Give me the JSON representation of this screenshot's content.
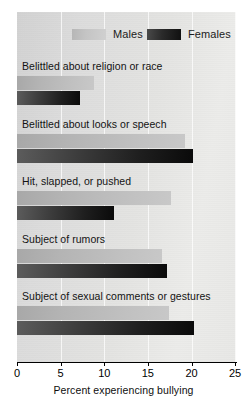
{
  "chart_data": {
    "type": "bar",
    "orientation": "horizontal",
    "title": "",
    "xlabel": "Percent experiencing bullying",
    "ylabel": "",
    "xlim": [
      0,
      25
    ],
    "xticks": [
      0,
      5,
      10,
      15,
      20,
      25
    ],
    "grid": true,
    "grid_axis": "x",
    "legend": {
      "position": "top",
      "entries": [
        "Males",
        "Females"
      ]
    },
    "categories": [
      "Belittled about religion or race",
      "Belittled about looks or speech",
      "Hit, slapped, or pushed",
      "Subject of rumors",
      "Subject of sexual comments or gestures"
    ],
    "series": [
      {
        "name": "Males",
        "color": "#bdbdbd",
        "values": [
          8.8,
          19.3,
          17.6,
          16.6,
          17.4
        ]
      },
      {
        "name": "Females",
        "color": "#1a1a1a",
        "values": [
          7.2,
          20.2,
          11.1,
          17.2,
          20.3
        ]
      }
    ]
  },
  "axis": {
    "tick_labels": [
      "0",
      "5",
      "10",
      "15",
      "20",
      "25"
    ],
    "title": "Percent experiencing bullying"
  },
  "legend": {
    "males_label": "Males",
    "females_label": "Females"
  },
  "groups": [
    {
      "label": "Belittled about religion or race",
      "males": 8.8,
      "females": 7.2
    },
    {
      "label": "Belittled about looks or speech",
      "males": 19.3,
      "females": 20.2
    },
    {
      "label": "Hit, slapped, or pushed",
      "males": 17.6,
      "females": 11.1
    },
    {
      "label": "Subject of rumors",
      "males": 16.6,
      "females": 17.2
    },
    {
      "label": "Subject of sexual comments or gestures",
      "males": 17.4,
      "females": 20.3
    }
  ]
}
